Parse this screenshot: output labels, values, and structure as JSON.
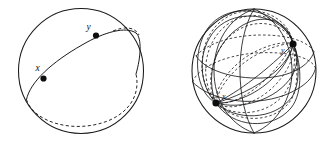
{
  "figure": {
    "background_color": "#ffffff",
    "stroke_color": "#1a1a1a",
    "node_color": "#0d0d0d",
    "width": 336,
    "height": 150
  },
  "panels": [
    {
      "id": "left-sphere",
      "name": "single-great-circle-sphere",
      "caption": "",
      "sphere": {
        "cx": 81,
        "cy": 71,
        "r": 62.5
      },
      "points": [
        {
          "id": "x",
          "label": "x",
          "cx": 43.5,
          "cy": 78.5,
          "r": 3.1,
          "label_x": 35.5,
          "label_y": 70.5
        },
        {
          "id": "y",
          "label": "y",
          "cx": 96.0,
          "cy": 35.5,
          "r": 3.1,
          "label_x": 86.5,
          "label_y": 30.0
        }
      ],
      "great_circles": 1,
      "front_arc_style": "solid",
      "back_arc_style": "dashed"
    },
    {
      "id": "right-sphere",
      "name": "pencil-of-great-circles-sphere",
      "caption": "",
      "sphere": {
        "cx": 254,
        "cy": 71,
        "r": 62.0
      },
      "points": [
        {
          "id": "x",
          "label": "x",
          "cx": 216.0,
          "cy": 103.0,
          "r": 3.6,
          "label_x": 222.0,
          "label_y": 99.0
        },
        {
          "id": "y",
          "label": "y",
          "cx": 293.0,
          "cy": 44.0,
          "r": 3.6,
          "label_x": 281.0,
          "label_y": 53.0
        }
      ],
      "great_circles": 9,
      "front_arc_style": "solid",
      "back_arc_style": "dashed"
    }
  ],
  "labels": {
    "x": "x",
    "y": "y"
  }
}
